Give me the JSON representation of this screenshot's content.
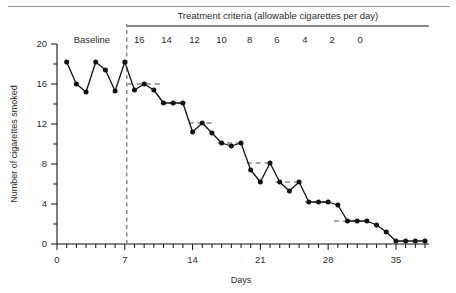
{
  "chart_data": {
    "type": "line",
    "title": "",
    "xlabel": "Days",
    "ylabel": "Number of cigarettes smoked",
    "xlim": [
      0,
      38
    ],
    "ylim": [
      0,
      20
    ],
    "xticks": [
      0,
      7,
      14,
      21,
      28,
      35
    ],
    "xticklabels": [
      "0",
      "7",
      "14",
      "21",
      "28",
      "35"
    ],
    "yticks": [
      0,
      4,
      8,
      12,
      16,
      20
    ],
    "yticklabels": [
      "0",
      "4",
      "8",
      "12",
      "16",
      "20"
    ],
    "minor_tick_interval_x": 1,
    "minor_tick_interval_y": 2,
    "grid": false,
    "legend": null,
    "phase_label_baseline": "Baseline",
    "phase_divider_day": 7.2,
    "header_label": "Treatment criteria (allowable cigarettes per day)",
    "criteria_labels": [
      "16",
      "14",
      "12",
      "10",
      "8",
      "6",
      "4",
      "2",
      "0"
    ],
    "criteria_label_days": [
      8.5,
      11.3,
      14.2,
      17.0,
      19.9,
      22.7,
      25.6,
      28.4,
      31.3
    ],
    "series": [
      {
        "name": "Cigarettes smoked per day",
        "x": [
          1,
          2,
          3,
          4,
          5,
          6,
          7,
          8,
          9,
          10,
          11,
          12,
          13,
          14,
          15,
          16,
          17,
          18,
          19,
          20,
          21,
          22,
          23,
          24,
          25,
          26,
          27,
          28,
          29,
          30,
          31,
          32,
          33,
          34,
          35,
          36,
          37,
          38
        ],
        "y": [
          18.2,
          16.0,
          15.2,
          18.2,
          17.4,
          15.3,
          18.2,
          15.4,
          16.0,
          15.4,
          14.1,
          14.1,
          14.1,
          11.2,
          12.1,
          11.1,
          10.1,
          9.8,
          10.1,
          7.4,
          6.2,
          8.1,
          6.2,
          5.3,
          6.2,
          4.2,
          4.2,
          4.2,
          3.9,
          2.3,
          2.3,
          2.3,
          1.9,
          1.2,
          0.3,
          0.3,
          0.3,
          0.3
        ]
      }
    ],
    "criterion_lines": [
      {
        "label": "16",
        "y": 16.0,
        "x_start": 7.3,
        "x_end": 10.6
      },
      {
        "label": "14",
        "y": 14.1,
        "x_start": 10.7,
        "x_end": 13.4
      },
      {
        "label": "12",
        "y": 12.1,
        "x_start": 13.6,
        "x_end": 16.4
      },
      {
        "label": "10",
        "y": 10.1,
        "x_start": 16.6,
        "x_end": 19.4
      },
      {
        "label": "8",
        "y": 8.1,
        "x_start": 19.6,
        "x_end": 22.4
      },
      {
        "label": "6",
        "y": 6.2,
        "x_start": 22.6,
        "x_end": 25.4
      },
      {
        "label": "4",
        "y": 4.2,
        "x_start": 25.6,
        "x_end": 28.4
      },
      {
        "label": "2",
        "y": 2.3,
        "x_start": 28.6,
        "x_end": 31.4
      }
    ]
  }
}
